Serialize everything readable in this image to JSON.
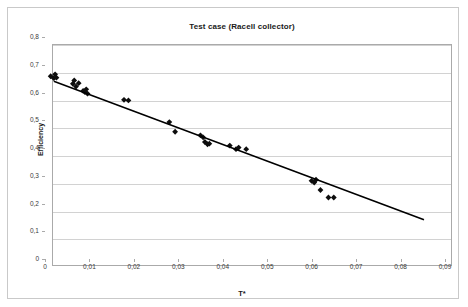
{
  "chart_data": {
    "type": "scatter",
    "title": "Test case (Racell collector)",
    "xlabel": "T*",
    "ylabel": "Efficiency",
    "xlim": [
      0,
      0.09
    ],
    "ylim": [
      0,
      0.8
    ],
    "grid": "horizontal",
    "legend": "none",
    "decimal_separator": ",",
    "xticks": [
      0,
      0.01,
      0.02,
      0.03,
      0.04,
      0.05,
      0.06,
      0.07,
      0.08,
      0.09
    ],
    "xtick_labels": [
      "0",
      "0,01",
      "0,02",
      "0,03",
      "0,04",
      "0,05",
      "0,06",
      "0,07",
      "0,08",
      "0,09"
    ],
    "yticks": [
      0,
      0.1,
      0.2,
      0.3,
      0.4,
      0.5,
      0.6,
      0.7,
      0.8
    ],
    "ytick_labels": [
      "0",
      "0,1",
      "0,2",
      "0,3",
      "0,4",
      "0,5",
      "0,6",
      "0,7",
      "0,8"
    ],
    "marker": "diamond",
    "marker_color": "#0d0d0d",
    "trendline_color": "#000000",
    "series": [
      {
        "name": "Measured efficiency",
        "points": [
          [
            0.0015,
            0.655
          ],
          [
            0.0022,
            0.648
          ],
          [
            0.0025,
            0.662
          ],
          [
            0.0028,
            0.65
          ],
          [
            0.0065,
            0.628
          ],
          [
            0.0068,
            0.64
          ],
          [
            0.0072,
            0.618
          ],
          [
            0.0078,
            0.63
          ],
          [
            0.0088,
            0.602
          ],
          [
            0.0092,
            0.598
          ],
          [
            0.0095,
            0.608
          ],
          [
            0.0098,
            0.592
          ],
          [
            0.018,
            0.57
          ],
          [
            0.019,
            0.568
          ],
          [
            0.0282,
            0.49
          ],
          [
            0.0295,
            0.455
          ],
          [
            0.0352,
            0.442
          ],
          [
            0.0358,
            0.435
          ],
          [
            0.0362,
            0.418
          ],
          [
            0.0368,
            0.41
          ],
          [
            0.0372,
            0.412
          ],
          [
            0.0418,
            0.405
          ],
          [
            0.0432,
            0.392
          ],
          [
            0.0438,
            0.398
          ],
          [
            0.0455,
            0.392
          ],
          [
            0.0602,
            0.278
          ],
          [
            0.0608,
            0.272
          ],
          [
            0.0612,
            0.282
          ],
          [
            0.0622,
            0.245
          ],
          [
            0.064,
            0.218
          ],
          [
            0.0652,
            0.218
          ]
        ]
      }
    ],
    "trendline": {
      "type": "linear",
      "x_start": 0.0022,
      "y_start": 0.637,
      "x_end": 0.0855,
      "y_end": 0.138
    }
  },
  "axes": {
    "y_label": "Efficiency",
    "x_label": "T*"
  }
}
